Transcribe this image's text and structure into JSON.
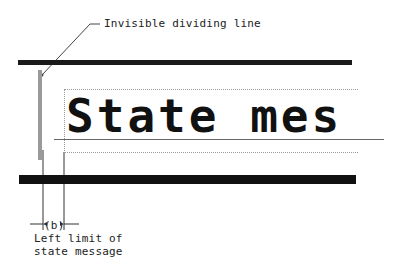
{
  "diagram": {
    "callout_top": "Invisible dividing line",
    "state_message_sample": "State mes",
    "dimension_label": "(b)",
    "callout_bottom_line1": "Left limit of",
    "callout_bottom_line2": "state message"
  },
  "colors": {
    "bars": "#111111",
    "dividing_line": "#9a9a9a",
    "dotted_box": "#999999"
  }
}
